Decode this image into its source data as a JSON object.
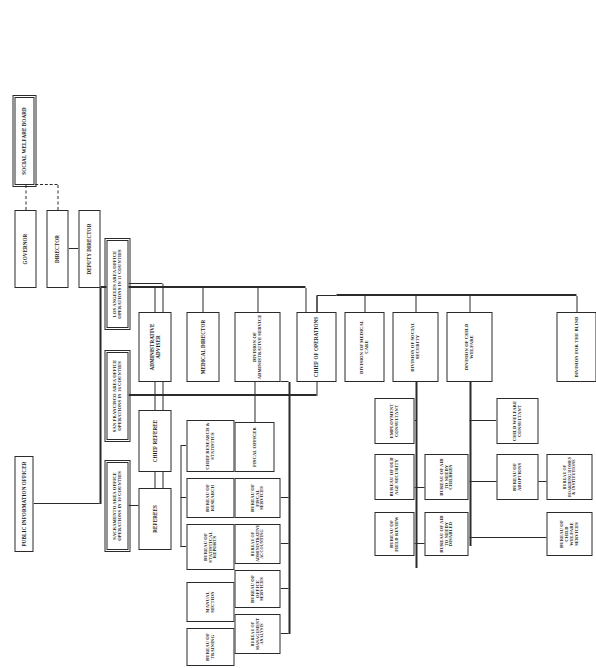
{
  "chart": {
    "orientation": "landscape-rotated-90",
    "line_color": "#2b2b2b",
    "box_fill": "#ffffff"
  },
  "nodes": {
    "governor": "GOVERNOR",
    "director": "DIRECTOR",
    "deputy_director": "DEPUTY DIRECTOR",
    "social_welfare_board": "SOCIAL WELFARE BOARD",
    "public_information_officer": "PUBLIC INFORMATION OFFICER",
    "administrative_adviser": "ADMINISTRATIVE ADVISER",
    "chief_referee": "CHIEF REFEREE",
    "referees": "REFEREES",
    "medical_director": "MEDICAL DIRECTOR",
    "chief_research_statistics": "CHIEF RESEARCH & STATISTICS",
    "bureau_research": "BUREAU OF RESEARCH",
    "bureau_statistical_reports": "BUREAU OF STATISTICAL REPORTS",
    "manual_section": "MANUAL SECTION",
    "bureau_training": "BUREAU OF TRAINING",
    "division_administrative_service": "DIVISION OF ADMINISTRATIVE SERVICE",
    "fiscal_officer": "FISCAL OFFICER",
    "bureau_fiscal_services": "BUREAU OF FISCAL SERVICES",
    "bureau_administrative_accounting": "BUREAU OF ADMINISTRATIVE ACCOUNTING",
    "bureau_office_services": "BUREAU OF OFFICE SERVICES",
    "bureau_management_analysis": "BUREAU OF MANAGEMENT ANALYSIS",
    "bureau_personnel": "BUREAU OF PERSONNEL",
    "chief_of_operations": "CHIEF OF OPERATIONS",
    "division_medical_care": "DIVISION OF MEDICAL CARE",
    "division_social_security": "DIVISION OF SOCIAL SECURITY",
    "division_child_welfare": "DIVISION OF CHILD WELFARE",
    "division_for_the_blind": "DIVISION FOR THE BLIND",
    "employment_consultant": "EMPLOYMENT CONSULTANT",
    "child_welfare_consultant": "CHILD WELFARE CONSULTANT",
    "bureau_old_age_security": "BUREAU OF OLD AGE SECURITY",
    "bureau_aid_needy_children": "BUREAU OF AID TO NEEDY CHILDREN",
    "bureau_aid_needy_disabled": "BUREAU OF AID TO NEEDY DISABLED",
    "bureau_field_review": "BUREAU OF FIELD REVIEW",
    "bureau_adoptions": "BUREAU OF ADOPTIONS",
    "bureau_boarding_homes": "BUREAU OF BOARDING HOMES & INSTITUTIONS",
    "bureau_child_welfare_services": "BUREAU OF CHILD WELFARE SERVICES",
    "sacramento_area_office": "SACRAMENTO AREA OFFICE OPERATIONS IN 30 COUNTIES",
    "san_francisco_area_office": "SAN FRANCISCO AREA OFFICE OPERATIONS IN 16 COUNTIES",
    "los_angeles_area_office": "LOS ANGELES AREA OFFICE OPERATIONS IN 11 COUNTIES"
  }
}
